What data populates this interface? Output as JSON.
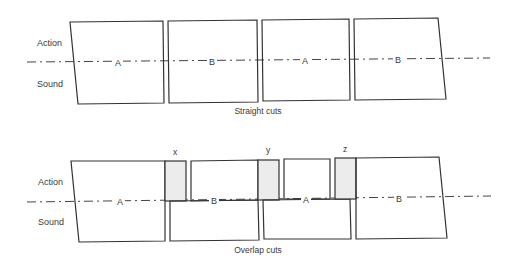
{
  "diagram": {
    "top": {
      "caption": "Straight cuts",
      "row_labels": {
        "action": "Action",
        "sound": "Sound"
      },
      "segments": [
        "A",
        "B",
        "A",
        "B"
      ]
    },
    "bottom": {
      "caption": "Overlap cuts",
      "row_labels": {
        "action": "Action",
        "sound": "Sound"
      },
      "segments": [
        "A",
        "B",
        "A",
        "B"
      ],
      "overlap_markers": [
        "x",
        "y",
        "z"
      ]
    },
    "colors": {
      "line": "#333333",
      "overlap_fill": "#ececec",
      "text": "#3a3a3a"
    }
  }
}
